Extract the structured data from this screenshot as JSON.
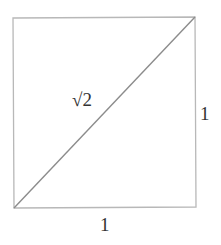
{
  "diagram": {
    "labels": {
      "diagonal": "√2",
      "right_side": "1",
      "bottom_side": "1"
    },
    "colors": {
      "square_stroke": "#b8b8b8",
      "diagonal_stroke": "#8c8c8c",
      "text": "#333333"
    }
  }
}
